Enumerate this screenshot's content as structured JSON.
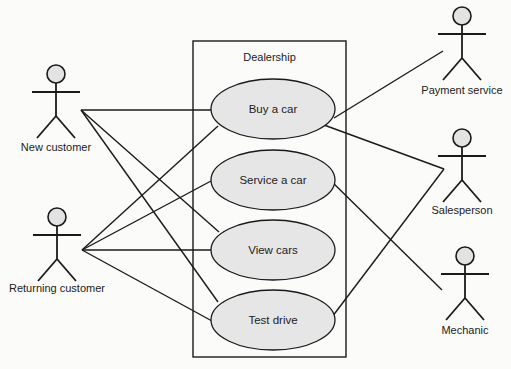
{
  "diagram": {
    "type": "uml-use-case",
    "system": {
      "label": "Dealership",
      "box": {
        "x": 193,
        "y": 41,
        "w": 153,
        "h": 316
      }
    },
    "use_cases": [
      {
        "id": "buy",
        "label": "Buy a car",
        "cx": 273,
        "cy": 109,
        "rx": 62,
        "ry": 30
      },
      {
        "id": "service",
        "label": "Service a car",
        "cx": 273,
        "cy": 180,
        "rx": 62,
        "ry": 30
      },
      {
        "id": "view",
        "label": "View cars",
        "cx": 273,
        "cy": 250,
        "rx": 62,
        "ry": 30
      },
      {
        "id": "test",
        "label": "Test drive",
        "cx": 273,
        "cy": 320,
        "rx": 62,
        "ry": 30
      }
    ],
    "actors": [
      {
        "id": "new",
        "label": "New customer",
        "x": 56,
        "y": 74,
        "label_y": 151,
        "anchor": [
          81,
          110
        ]
      },
      {
        "id": "returning",
        "label": "Returning customer",
        "x": 57,
        "y": 217,
        "label_y": 292,
        "anchor": [
          82,
          250
        ]
      },
      {
        "id": "payment",
        "label": "Payment service",
        "x": 462,
        "y": 16,
        "label_y": 94,
        "anchor": [
          443,
          51
        ]
      },
      {
        "id": "salesperson",
        "label": "Salesperson",
        "x": 462,
        "y": 138,
        "label_y": 214,
        "anchor": [
          444,
          169
        ]
      },
      {
        "id": "mechanic",
        "label": "Mechanic",
        "x": 465,
        "y": 256,
        "label_y": 334,
        "anchor": [
          442,
          290
        ]
      }
    ],
    "associations": [
      {
        "from": "new",
        "to": "buy",
        "end": [
          211,
          110
        ]
      },
      {
        "from": "new",
        "to": "view",
        "end": [
          219,
          232
        ]
      },
      {
        "from": "new",
        "to": "test",
        "end": [
          218,
          302
        ]
      },
      {
        "from": "returning",
        "to": "buy",
        "end": [
          218,
          126
        ]
      },
      {
        "from": "returning",
        "to": "service",
        "end": [
          211,
          181
        ]
      },
      {
        "from": "returning",
        "to": "view",
        "end": [
          211,
          250
        ]
      },
      {
        "from": "returning",
        "to": "test",
        "end": [
          212,
          321
        ]
      },
      {
        "from": "payment",
        "to": "buy",
        "end": [
          334,
          118
        ]
      },
      {
        "from": "salesperson",
        "to": "buy",
        "end": [
          324,
          125
        ]
      },
      {
        "from": "salesperson",
        "to": "test",
        "end": [
          329,
          321
        ]
      },
      {
        "from": "mechanic",
        "to": "service",
        "end": [
          328,
          178
        ]
      }
    ]
  }
}
